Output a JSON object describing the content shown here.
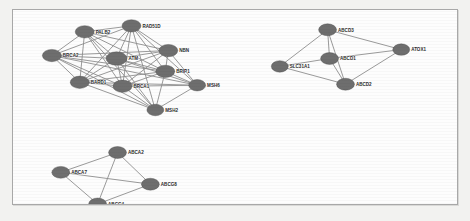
{
  "figure": {
    "type": "network-graph",
    "title": "",
    "background_color": "#fdfdfd",
    "frame_color": "#a8a8a8",
    "node_fill": "#6e6e6e",
    "edge_color": "#8d8d8d"
  },
  "clusters": [
    {
      "id": "cluster-dna-repair",
      "name": "DNA repair cluster",
      "nodes": [
        {
          "id": "PALB2",
          "label": "PALB2",
          "x": 72,
          "y": 22,
          "rx": 9.5,
          "ry": 6.2
        },
        {
          "id": "RAD51D",
          "label": "RAD51D",
          "x": 119,
          "y": 16,
          "rx": 9.5,
          "ry": 6.2
        },
        {
          "id": "BRCA2",
          "label": "BRCA2",
          "x": 39,
          "y": 46,
          "rx": 9.5,
          "ry": 6.2
        },
        {
          "id": "ATM",
          "label": "ATM",
          "x": 104,
          "y": 49,
          "rx": 10.5,
          "ry": 6.8
        },
        {
          "id": "NBN",
          "label": "NBN",
          "x": 156,
          "y": 41,
          "rx": 9.5,
          "ry": 6.2
        },
        {
          "id": "BRIP1",
          "label": "BRIP1",
          "x": 153,
          "y": 62,
          "rx": 9.5,
          "ry": 6.2
        },
        {
          "id": "BARD1",
          "label": "BARD1",
          "x": 67,
          "y": 73,
          "rx": 9.5,
          "ry": 6.2
        },
        {
          "id": "BRCA1",
          "label": "BRCA1",
          "x": 110,
          "y": 77,
          "rx": 9.5,
          "ry": 6.2
        },
        {
          "id": "MSH6",
          "label": "MSH6",
          "x": 185,
          "y": 76,
          "rx": 8.5,
          "ry": 5.8
        },
        {
          "id": "MSH2",
          "label": "MSH2",
          "x": 143,
          "y": 101,
          "rx": 8.5,
          "ry": 5.8
        }
      ],
      "edges": [
        [
          "PALB2",
          "RAD51D"
        ],
        [
          "PALB2",
          "BRCA2"
        ],
        [
          "PALB2",
          "ATM"
        ],
        [
          "PALB2",
          "BARD1"
        ],
        [
          "PALB2",
          "BRCA1"
        ],
        [
          "PALB2",
          "BRIP1"
        ],
        [
          "PALB2",
          "NBN"
        ],
        [
          "PALB2",
          "MSH2"
        ],
        [
          "RAD51D",
          "BRCA2"
        ],
        [
          "RAD51D",
          "ATM"
        ],
        [
          "RAD51D",
          "NBN"
        ],
        [
          "RAD51D",
          "BRIP1"
        ],
        [
          "RAD51D",
          "BARD1"
        ],
        [
          "RAD51D",
          "BRCA1"
        ],
        [
          "RAD51D",
          "MSH6"
        ],
        [
          "RAD51D",
          "MSH2"
        ],
        [
          "BRCA2",
          "ATM"
        ],
        [
          "BRCA2",
          "BARD1"
        ],
        [
          "BRCA2",
          "BRCA1"
        ],
        [
          "BRCA2",
          "BRIP1"
        ],
        [
          "BRCA2",
          "NBN"
        ],
        [
          "BRCA2",
          "MSH2"
        ],
        [
          "BRCA2",
          "MSH6"
        ],
        [
          "ATM",
          "NBN"
        ],
        [
          "ATM",
          "BRIP1"
        ],
        [
          "ATM",
          "BARD1"
        ],
        [
          "ATM",
          "BRCA1"
        ],
        [
          "ATM",
          "MSH6"
        ],
        [
          "ATM",
          "MSH2"
        ],
        [
          "NBN",
          "BRIP1"
        ],
        [
          "NBN",
          "BRCA1"
        ],
        [
          "NBN",
          "MSH6"
        ],
        [
          "NBN",
          "BARD1"
        ],
        [
          "BRIP1",
          "BARD1"
        ],
        [
          "BRIP1",
          "BRCA1"
        ],
        [
          "BRIP1",
          "MSH6"
        ],
        [
          "BRIP1",
          "MSH2"
        ],
        [
          "BARD1",
          "BRCA1"
        ],
        [
          "BARD1",
          "MSH2"
        ],
        [
          "BARD1",
          "MSH6"
        ],
        [
          "BRCA1",
          "MSH6"
        ],
        [
          "BRCA1",
          "MSH2"
        ],
        [
          "MSH6",
          "MSH2"
        ]
      ]
    },
    {
      "id": "cluster-abcd-peroxisomal",
      "name": "ABCD transporter cluster",
      "nodes": [
        {
          "id": "ABCD3",
          "label": "ABCD3",
          "x": 316,
          "y": 20,
          "rx": 9.0,
          "ry": 6.0
        },
        {
          "id": "ABCD1",
          "label": "ABCD1",
          "x": 318,
          "y": 49,
          "rx": 9.0,
          "ry": 6.0
        },
        {
          "id": "SLC31A1",
          "label": "SLC31A1",
          "x": 268,
          "y": 57,
          "rx": 8.5,
          "ry": 5.8
        },
        {
          "id": "ABCD2",
          "label": "ABCD2",
          "x": 334,
          "y": 75,
          "rx": 9.0,
          "ry": 6.0
        },
        {
          "id": "ATOX1",
          "label": "ATOX1",
          "x": 390,
          "y": 40,
          "rx": 8.5,
          "ry": 5.8
        }
      ],
      "edges": [
        [
          "ABCD3",
          "ABCD1"
        ],
        [
          "ABCD3",
          "SLC31A1"
        ],
        [
          "ABCD3",
          "ABCD2"
        ],
        [
          "ABCD3",
          "ATOX1"
        ],
        [
          "ABCD1",
          "SLC31A1"
        ],
        [
          "ABCD1",
          "ABCD2"
        ],
        [
          "ABCD1",
          "ATOX1"
        ],
        [
          "SLC31A1",
          "ABCD2"
        ],
        [
          "ABCD2",
          "ATOX1"
        ]
      ]
    },
    {
      "id": "cluster-abca-abcg",
      "name": "ABCA/ABCG transporter cluster",
      "nodes": [
        {
          "id": "ABCA2",
          "label": "ABCA2",
          "x": 105,
          "y": 144,
          "rx": 9.0,
          "ry": 6.0
        },
        {
          "id": "ABCA7",
          "label": "ABCA7",
          "x": 48,
          "y": 164,
          "rx": 9.0,
          "ry": 6.0
        },
        {
          "id": "ABCG8",
          "label": "ABCG8",
          "x": 138,
          "y": 176,
          "rx": 9.0,
          "ry": 6.0
        },
        {
          "id": "ABCG4",
          "label": "ABCG4",
          "x": 85,
          "y": 196,
          "rx": 9.0,
          "ry": 6.0
        }
      ],
      "edges": [
        [
          "ABCA2",
          "ABCA7"
        ],
        [
          "ABCA2",
          "ABCG8"
        ],
        [
          "ABCA2",
          "ABCG4"
        ],
        [
          "ABCA7",
          "ABCG4"
        ],
        [
          "ABCA7",
          "ABCG8"
        ],
        [
          "ABCG8",
          "ABCG4"
        ]
      ]
    }
  ]
}
